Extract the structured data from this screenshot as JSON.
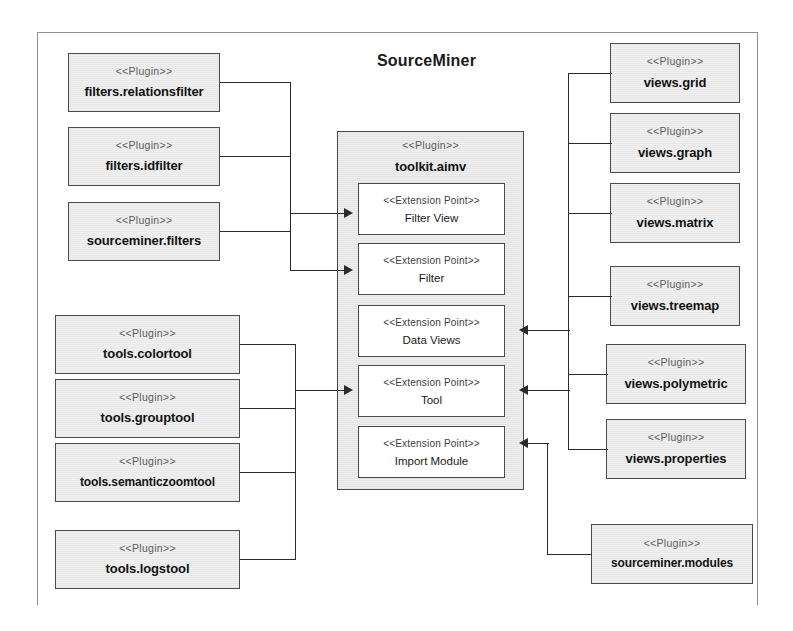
{
  "diagram": {
    "title": "SourceMiner",
    "stereotype_plugin": "<<Plugin>>",
    "stereotype_extension_point": "<<Extension Point>>"
  },
  "container": {
    "stereotype": "<<Plugin>>",
    "name": "toolkit.aimv",
    "extension_points": [
      {
        "stereotype": "<<Extension Point>>",
        "name": "Filter View"
      },
      {
        "stereotype": "<<Extension Point>>",
        "name": "Filter"
      },
      {
        "stereotype": "<<Extension Point>>",
        "name": "Data Views"
      },
      {
        "stereotype": "<<Extension Point>>",
        "name": "Tool"
      },
      {
        "stereotype": "<<Extension Point>>",
        "name": "Import Module"
      }
    ]
  },
  "left_filters": {
    "group_label": "filter plugins",
    "items": [
      {
        "stereotype": "<<Plugin>>",
        "name": "filters.relationsfilter"
      },
      {
        "stereotype": "<<Plugin>>",
        "name": "filters.idfilter"
      },
      {
        "stereotype": "<<Plugin>>",
        "name": "sourceminer.filters"
      }
    ]
  },
  "left_tools": {
    "group_label": "tool plugins",
    "items": [
      {
        "stereotype": "<<Plugin>>",
        "name": "tools.colortool"
      },
      {
        "stereotype": "<<Plugin>>",
        "name": "tools.grouptool"
      },
      {
        "stereotype": "<<Plugin>>",
        "name": "tools.semanticzoomtool"
      },
      {
        "stereotype": "<<Plugin>>",
        "name": "tools.logstool"
      }
    ]
  },
  "right_views": {
    "group_label": "view plugins",
    "items": [
      {
        "stereotype": "<<Plugin>>",
        "name": "views.grid"
      },
      {
        "stereotype": "<<Plugin>>",
        "name": "views.graph"
      },
      {
        "stereotype": "<<Plugin>>",
        "name": "views.matrix"
      },
      {
        "stereotype": "<<Plugin>>",
        "name": "views.treemap"
      },
      {
        "stereotype": "<<Plugin>>",
        "name": "views.polymetric"
      },
      {
        "stereotype": "<<Plugin>>",
        "name": "views.properties"
      }
    ]
  },
  "right_modules": {
    "group_label": "module plugins",
    "items": [
      {
        "stereotype": "<<Plugin>>",
        "name": "sourceminer.modules"
      }
    ]
  },
  "colors": {
    "box_fill": "#f0f0f0",
    "box_border": "#4a4a4a",
    "container_fill": "#eeeeee",
    "connector": "#2b2b2b",
    "frame_border": "#8f8f8f",
    "text": "#121212",
    "stereotype_text": "#5c5c5c"
  }
}
